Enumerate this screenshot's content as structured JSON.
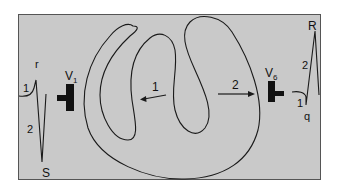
{
  "colors": {
    "panel_bg": "#c9c9c9",
    "panel_border": "#555555",
    "line": "#1a1a1a"
  },
  "leads": {
    "v1": {
      "label": "V",
      "subscript": "1"
    },
    "v6": {
      "label": "V",
      "subscript": "6"
    }
  },
  "waveform_v1": {
    "peak_label": "r",
    "trough_label": "S",
    "phase_1": "1",
    "phase_2": "2"
  },
  "waveform_v6": {
    "peak_label": "R",
    "trough_label": "q",
    "phase_1": "1",
    "phase_2": "2"
  },
  "vectors": {
    "septal": "1",
    "lateral": "2"
  }
}
